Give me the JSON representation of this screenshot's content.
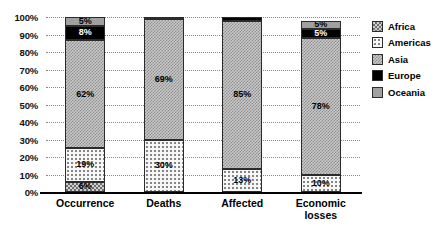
{
  "chart_data": {
    "type": "bar",
    "subtype": "stacked-100-percent",
    "title": "",
    "xlabel": "",
    "ylabel": "",
    "ylim": [
      0,
      100
    ],
    "ytick_labels": [
      "0%",
      "10%",
      "20%",
      "30%",
      "40%",
      "50%",
      "60%",
      "70%",
      "80%",
      "90%",
      "100%"
    ],
    "ytick_values": [
      0,
      10,
      20,
      30,
      40,
      50,
      60,
      70,
      80,
      90,
      100
    ],
    "grid": true,
    "grid_style": "dotted",
    "legend_position": "right",
    "categories": [
      "Occurrence",
      "Deaths",
      "Affected",
      "Economic losses"
    ],
    "series": [
      {
        "name": "Africa",
        "values": [
          6,
          0,
          0,
          0
        ],
        "labels": [
          "6%",
          "",
          "",
          ""
        ]
      },
      {
        "name": "Americas",
        "values": [
          19,
          30,
          13,
          10
        ],
        "labels": [
          "19%",
          "30%",
          "13%",
          "10%"
        ]
      },
      {
        "name": "Asia",
        "values": [
          62,
          69,
          85,
          78
        ],
        "labels": [
          "62%",
          "69%",
          "85%",
          "78%"
        ]
      },
      {
        "name": "Europe",
        "values": [
          8,
          1,
          2,
          5
        ],
        "labels": [
          "8%",
          "",
          "",
          "5%"
        ]
      },
      {
        "name": "Oceania",
        "values": [
          5,
          0,
          0,
          5
        ],
        "labels": [
          "5%",
          "",
          "",
          "5%"
        ]
      }
    ]
  },
  "legend": {
    "items": [
      {
        "label": "Africa",
        "pattern": "checker-coarse"
      },
      {
        "label": "Americas",
        "pattern": "dotted-light"
      },
      {
        "label": "Asia",
        "pattern": "checker-fine"
      },
      {
        "label": "Europe",
        "pattern": "solid-black"
      },
      {
        "label": "Oceania",
        "pattern": "solid-gray"
      }
    ]
  },
  "colors": {
    "africa": "#cfcfcf",
    "americas": "#f7f7f7",
    "asia": "#c9c9c9",
    "europe": "#000000",
    "oceania": "#a0a0a0",
    "axis": "#000000",
    "grid": "#8a8a8a",
    "background": "#ffffff"
  }
}
